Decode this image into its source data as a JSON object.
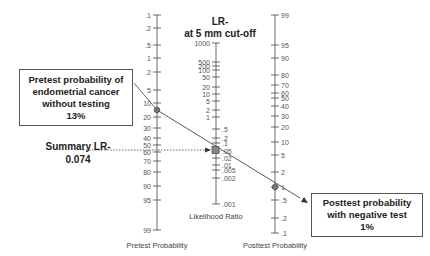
{
  "nomogram": {
    "header_line1": "LR-",
    "header_line2": "at 5 mm cut-off",
    "axes": {
      "pretest": {
        "title": "Pretest Probability",
        "ticks": [
          {
            "label": ".1",
            "y": 15
          },
          {
            "label": ".2",
            "y": 28
          },
          {
            "label": ".5",
            "y": 45
          },
          {
            "label": "1",
            "y": 58
          },
          {
            "label": "2",
            "y": 72
          },
          {
            "label": "5",
            "y": 90
          },
          {
            "label": "10",
            "y": 103
          },
          {
            "label": "20",
            "y": 117
          },
          {
            "label": "30",
            "y": 128
          },
          {
            "label": "40",
            "y": 138
          },
          {
            "label": "50",
            "y": 145
          },
          {
            "label": "60",
            "y": 152
          },
          {
            "label": "70",
            "y": 161
          },
          {
            "label": "80",
            "y": 172
          },
          {
            "label": "90",
            "y": 186
          },
          {
            "label": "95",
            "y": 200
          },
          {
            "label": "99",
            "y": 230
          }
        ]
      },
      "likelihood_ratio": {
        "title": "Likelihood Ratio",
        "ticks": [
          {
            "label": "1000",
            "y": 43
          },
          {
            "label": "500",
            "y": 62
          },
          {
            "label": "200",
            "y": 66
          },
          {
            "label": "100",
            "y": 70
          },
          {
            "label": "50",
            "y": 77
          },
          {
            "label": "20",
            "y": 87
          },
          {
            "label": "10",
            "y": 94
          },
          {
            "label": "5",
            "y": 101
          },
          {
            "label": "2",
            "y": 110
          },
          {
            "label": "1",
            "y": 117
          },
          {
            "label": ".5",
            "y": 129
          },
          {
            "label": ".2",
            "y": 138
          },
          {
            "label": ".1",
            "y": 143
          },
          {
            "label": ".05",
            "y": 151
          },
          {
            "label": ".02",
            "y": 158
          },
          {
            "label": ".01",
            "y": 165
          },
          {
            "label": ".005",
            "y": 170
          },
          {
            "label": ".002",
            "y": 178
          },
          {
            "label": ".001",
            "y": 204
          }
        ]
      },
      "posttest": {
        "title": "Posttest Probability",
        "ticks": [
          {
            "label": "99",
            "y": 15
          },
          {
            "label": "95",
            "y": 45
          },
          {
            "label": "90",
            "y": 58
          },
          {
            "label": "80",
            "y": 75
          },
          {
            "label": "70",
            "y": 85
          },
          {
            "label": "60",
            "y": 93
          },
          {
            "label": "50",
            "y": 98
          },
          {
            "label": "40",
            "y": 106
          },
          {
            "label": "30",
            "y": 116
          },
          {
            "label": "20",
            "y": 127
          },
          {
            "label": "10",
            "y": 142
          },
          {
            "label": "5",
            "y": 155
          },
          {
            "label": "2",
            "y": 172
          },
          {
            "label": "1",
            "y": 187
          },
          {
            "label": ".5",
            "y": 200
          },
          {
            "label": ".2",
            "y": 218
          },
          {
            "label": ".1",
            "y": 233
          }
        ]
      }
    },
    "points": {
      "pretest": {
        "value": "13%",
        "y": 110
      },
      "summary_lr": {
        "value": "0.074",
        "y": 150
      },
      "posttest": {
        "value": "1%",
        "y": 187
      }
    },
    "callouts": {
      "pretest": {
        "line1": "Pretest probability of",
        "line2": "endometrial cancer",
        "line3": "without testing",
        "line4": "13%"
      },
      "summary": {
        "line1": "Summary LR-",
        "line2": "0.074"
      },
      "posttest": {
        "line1": "Posttest probability",
        "line2": "with negative test",
        "line3": "1%"
      }
    },
    "colors": {
      "axis": "#444444",
      "line": "#444444",
      "marker": "#777777"
    }
  }
}
